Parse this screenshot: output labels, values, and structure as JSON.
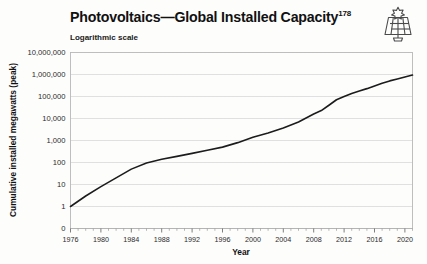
{
  "figure": {
    "title": "Photovoltaics—Global Installed Capacity",
    "title_superscript": "178",
    "subtitle": "Logarithmic scale",
    "icon_name": "solar-panel-icon",
    "background_color": "#fdfdfc",
    "line_color": "#1c1c1c",
    "grid_color": "#d8d8d8"
  },
  "chart_data": {
    "type": "line",
    "title": "Photovoltaics—Global Installed Capacity",
    "subtitle": "Logarithmic scale",
    "xlabel": "Year",
    "ylabel": "Cumulative installed megawatts (peak)",
    "yscale": "log",
    "grid": true,
    "legend": "none",
    "xlim": [
      1976,
      2021
    ],
    "ylim": [
      1,
      10000000
    ],
    "xticks": [
      1976,
      1980,
      1984,
      1988,
      1992,
      1996,
      2000,
      2004,
      2008,
      2012,
      2016,
      2020
    ],
    "xtick_labels": [
      "1976",
      "1980",
      "1984",
      "1988",
      "1992",
      "1996",
      "2000",
      "2004",
      "2008",
      "2012",
      "2016",
      "2020"
    ],
    "x_minor_tick_step": 1,
    "yticks": [
      0,
      1,
      10,
      100,
      1000,
      10000,
      100000,
      1000000,
      10000000
    ],
    "ytick_labels": [
      "0",
      "1",
      "10",
      "100",
      "1,000",
      "10,000",
      "100,000",
      "1,000,000",
      "10,000,000"
    ],
    "series": [
      {
        "name": "Cumulative installed photovoltaic capacity",
        "x": [
          1976,
          1978,
          1980,
          1982,
          1984,
          1986,
          1988,
          1990,
          1992,
          1994,
          1996,
          1998,
          2000,
          2002,
          2004,
          2006,
          2008,
          2009,
          2010,
          2011,
          2012,
          2013,
          2014,
          2015,
          2016,
          2017,
          2018,
          2019,
          2020,
          2021
        ],
        "values": [
          1,
          3,
          8,
          20,
          50,
          95,
          140,
          190,
          260,
          360,
          500,
          800,
          1400,
          2200,
          3700,
          6900,
          16000,
          23000,
          40000,
          71000,
          100000,
          138000,
          178000,
          228000,
          303000,
          402000,
          512000,
          627000,
          773000,
          940000
        ]
      }
    ]
  },
  "axis": {
    "x_title": "Year",
    "y_title": "Cumulative installed megawatts (peak)"
  }
}
